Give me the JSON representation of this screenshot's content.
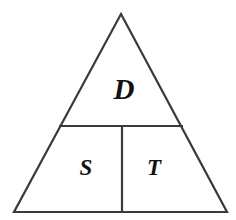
{
  "diagram": {
    "name": "partitioned-triangle",
    "background_color": "#ffffff",
    "stroke_color": "#3a3a3a",
    "label_color": "#111111",
    "stroke_width": 2.2,
    "outline": {
      "apex": {
        "x": 121,
        "y": 14
      },
      "bottom_left": {
        "x": 14,
        "y": 212
      },
      "bottom_right": {
        "x": 227,
        "y": 212
      }
    },
    "dividers": [
      {
        "name": "horizontal-divider",
        "orientation": "horizontal",
        "x1": 59,
        "y1": 126,
        "x2": 183,
        "y2": 126
      },
      {
        "name": "vertical-divider",
        "orientation": "vertical",
        "x1": 122,
        "y1": 126,
        "x2": 122,
        "y2": 212
      }
    ],
    "regions": [
      {
        "id": "region-d",
        "label": "D",
        "position": "top",
        "cx": 124,
        "cy": 92,
        "font_size": 29
      },
      {
        "id": "region-s",
        "label": "S",
        "position": "bottom-left",
        "cx": 86,
        "cy": 170,
        "font_size": 23
      },
      {
        "id": "region-t",
        "label": "T",
        "position": "bottom-right",
        "cx": 154,
        "cy": 170,
        "font_size": 23
      }
    ]
  }
}
